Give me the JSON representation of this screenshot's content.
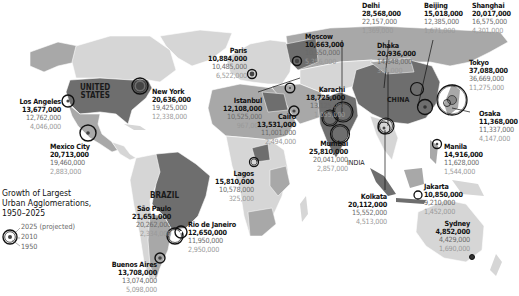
{
  "title": "Growth of Largest Urban Agglomerations, 1950–2025",
  "legend": {
    "title_line1": "Growth of Largest",
    "title_line2": "Urban Agglomerations,",
    "title_line3": "1950–2025",
    "items": [
      "2025 (projected)",
      "2010",
      "1950"
    ]
  },
  "countries": {
    "us": "UNITED\nSTATES",
    "us_line1": "UNITED",
    "us_line2": "STATES",
    "brazil": "BRAZIL",
    "china": "CHINA",
    "india": "INDIA"
  },
  "colors": {
    "ocean": "#ffffff",
    "land_light": "#d6d6d6",
    "land_mid": "#a8a8a8",
    "land_dark": "#6e6e6e",
    "circle_stroke": "#111111"
  },
  "cities": [
    {
      "name": "Los Angeles",
      "v2025": "13,677,000",
      "v2010": "12,762,000",
      "v1950": "4,046,000"
    },
    {
      "name": "New York",
      "v2025": "20,636,000",
      "v2010": "19,425,000",
      "v1950": "12,338,000"
    },
    {
      "name": "Mexico City",
      "v2025": "20,713,000",
      "v2010": "19,460,000",
      "v1950": "2,883,000"
    },
    {
      "name": "Paris",
      "v2025": "10,884,000",
      "v2010": "10,485,000",
      "v1950": "6,522,000"
    },
    {
      "name": "Moscow",
      "v2025": "10,663,000",
      "v2010": "10,550,000",
      "v1950": "5,356,000"
    },
    {
      "name": "Istanbul",
      "v2025": "12,108,000",
      "v2010": "10,525,000",
      "v1950": "967,000"
    },
    {
      "name": "Cairo",
      "v2025": "13,531,000",
      "v2010": "11,001,000",
      "v1950": "2,494,000"
    },
    {
      "name": "Karachi",
      "v2025": "18,725,000",
      "v2010": "13,125,000",
      "v1950": "1,055,000"
    },
    {
      "name": "Mumbai",
      "v2025": "25,810,000",
      "v2010": "20,041,000",
      "v1950": "2,857,000"
    },
    {
      "name": "Delhi",
      "v2025": "28,568,000",
      "v2010": "22,157,000",
      "v1950": "1,369,000"
    },
    {
      "name": "Dhaka",
      "v2025": "20,936,000",
      "v2010": "14,648,000",
      "v1950": "336,000"
    },
    {
      "name": "Beijing",
      "v2025": "15,018,000",
      "v2010": "12,385,000",
      "v1950": "1,671,000"
    },
    {
      "name": "Shanghai",
      "v2025": "20,017,000",
      "v2010": "16,575,000",
      "v1950": "4,301,000"
    },
    {
      "name": "Tokyo",
      "v2025": "37,088,000",
      "v2010": "36,669,000",
      "v1950": "11,275,000"
    },
    {
      "name": "Osaka",
      "v2025": "11,368,000",
      "v2010": "11,337,000",
      "v1950": "4,147,000"
    },
    {
      "name": "Manila",
      "v2025": "14,916,000",
      "v2010": "11,628,000",
      "v1950": "1,544,000"
    },
    {
      "name": "Jakarta",
      "v2025": "10,850,000",
      "v2010": "9,210,000",
      "v1950": "1,452,000"
    },
    {
      "name": "Kolkata",
      "v2025": "20,112,000",
      "v2010": "15,552,000",
      "v1950": "4,513,000"
    },
    {
      "name": "Sydney",
      "v2025": "4,852,000",
      "v2010": "4,429,000",
      "v1950": "1,690,000"
    },
    {
      "name": "Lagos",
      "v2025": "15,810,000",
      "v2010": "10,578,000",
      "v1950": "325,000"
    },
    {
      "name": "São Paulo",
      "v2025": "21,651,000",
      "v2010": "20,262,000",
      "v1950": "2,334,000"
    },
    {
      "name": "Rio de Janeiro",
      "v2025": "12,650,000",
      "v2010": "11,950,000",
      "v1950": "2,950,000"
    },
    {
      "name": "Buenos Aires",
      "v2025": "13,708,000",
      "v2010": "13,074,000",
      "v1950": "5,098,000"
    }
  ]
}
